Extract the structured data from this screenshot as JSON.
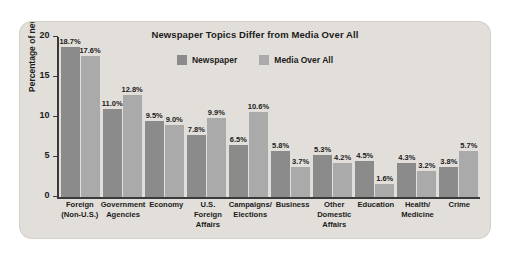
{
  "figure": {
    "background_color": "#e2dfda",
    "title": "Newspaper Topics Differ from Media Over All"
  },
  "legend": {
    "position": "top-center",
    "entries": [
      {
        "label": "Newspaper",
        "color": "#8b8b8b"
      },
      {
        "label": "Media Over All",
        "color": "#aaaaaa"
      }
    ]
  },
  "axes": {
    "ylabel": "Percentage of newshole",
    "yticks": [
      "0",
      "5",
      "10",
      "15",
      "20"
    ],
    "ymin": 0,
    "ymax": 20
  },
  "chart_data": {
    "type": "bar",
    "title": "Newspaper Topics Differ from Media Over All",
    "xlabel": "",
    "ylabel": "Percentage of newshole",
    "ylim": [
      0,
      20
    ],
    "yticks": [
      0,
      5,
      10,
      15,
      20
    ],
    "grid": false,
    "legend_position": "top-center",
    "categories": [
      "Foreign\n(Non-U.S.)",
      "Government\nAgencies",
      "Economy",
      "U.S.\nForeign\nAffairs",
      "Campaigns/\nElections",
      "Business",
      "Other\nDomestic\nAffairs",
      "Education",
      "Health/\nMedicine",
      "Crime"
    ],
    "series": [
      {
        "name": "Newspaper",
        "color": "#8b8b8b",
        "values": [
          18.7,
          11.0,
          9.5,
          7.8,
          6.5,
          5.8,
          5.3,
          4.5,
          4.3,
          3.8
        ],
        "labels": [
          "18.7%",
          "11.0%",
          "9.5%",
          "7.8%",
          "6.5%",
          "5.8%",
          "5.3%",
          "4.5%",
          "4.3%",
          "3.8%"
        ]
      },
      {
        "name": "Media Over All",
        "color": "#aaaaaa",
        "values": [
          17.6,
          12.8,
          9.0,
          9.9,
          10.6,
          3.7,
          4.2,
          1.6,
          3.2,
          5.7
        ],
        "labels": [
          "17.6%",
          "12.8%",
          "9.0%",
          "9.9%",
          "10.6%",
          "3.7%",
          "4.2%",
          "1.6%",
          "3.2%",
          "5.7%"
        ]
      }
    ]
  }
}
